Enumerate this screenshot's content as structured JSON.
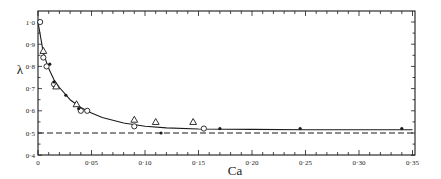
{
  "chart_data": {
    "type": "scatter",
    "title": "",
    "xlabel": "Ca",
    "ylabel": "λ",
    "xlim": [
      0,
      0.35
    ],
    "ylim": [
      0.4,
      1.0
    ],
    "grid": false,
    "legend": null,
    "x_ticks": [
      0,
      0.05,
      0.1,
      0.15,
      0.2,
      0.25,
      0.3,
      0.35
    ],
    "x_tick_labels": [
      "0",
      "0·05",
      "0·10",
      "0·15",
      "0·20",
      "0·25",
      "0·30",
      "0·35"
    ],
    "y_ticks": [
      0.4,
      0.5,
      0.6,
      0.7,
      0.8,
      0.9,
      1.0
    ],
    "y_tick_labels": [
      "0·4",
      "0·5",
      "0·6",
      "0·7",
      "0·8",
      "0·9",
      "1·0"
    ],
    "series": [
      {
        "name": "open circles",
        "marker": "open-circle",
        "x": [
          0.002,
          0.005,
          0.008,
          0.015,
          0.04,
          0.046,
          0.09,
          0.155
        ],
        "y": [
          1.0,
          0.84,
          0.8,
          0.72,
          0.6,
          0.6,
          0.53,
          0.52
        ]
      },
      {
        "name": "open triangles",
        "marker": "open-triangle",
        "x": [
          0.005,
          0.017,
          0.036,
          0.09,
          0.11,
          0.145
        ],
        "y": [
          0.87,
          0.71,
          0.63,
          0.56,
          0.55,
          0.55
        ]
      },
      {
        "name": "filled circles",
        "marker": "filled-circle",
        "x": [
          0.011,
          0.015,
          0.026,
          0.038,
          0.115,
          0.17,
          0.245,
          0.34
        ],
        "y": [
          0.81,
          0.73,
          0.67,
          0.61,
          0.5,
          0.52,
          0.52,
          0.52
        ]
      }
    ],
    "fitted_curve": {
      "name": "theory",
      "style": "solid",
      "x": [
        0.0,
        0.005,
        0.01,
        0.015,
        0.02,
        0.03,
        0.04,
        0.05,
        0.06,
        0.08,
        0.1,
        0.12,
        0.15,
        0.2,
        0.25,
        0.3,
        0.35
      ],
      "y": [
        1.0,
        0.86,
        0.79,
        0.74,
        0.705,
        0.65,
        0.615,
        0.59,
        0.57,
        0.545,
        0.53,
        0.523,
        0.518,
        0.516,
        0.515,
        0.515,
        0.515
      ]
    },
    "reference_line": {
      "name": "asymptote",
      "style": "dashed",
      "y": 0.5
    }
  }
}
